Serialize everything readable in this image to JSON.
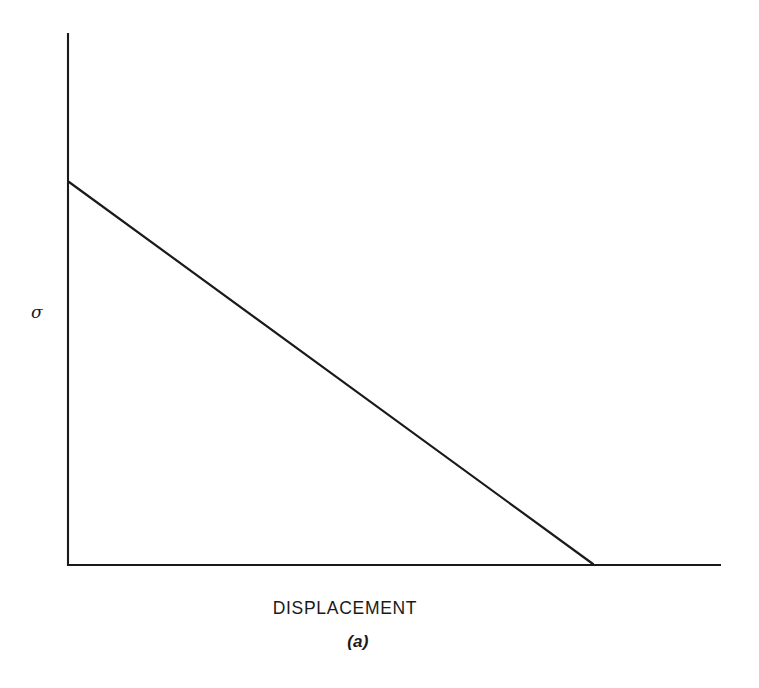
{
  "figure": {
    "caption": "(a)",
    "background_color": "#ffffff",
    "line_color": "#1a1a1a"
  },
  "chart_data": {
    "type": "line",
    "title": "",
    "subtitle": "",
    "xlabel": "DISPLACEMENT",
    "ylabel": "σ",
    "ylabel_description": "sigma (stress)",
    "grid": false,
    "legend": null,
    "axis_ticks": {
      "x": [],
      "y": []
    },
    "xlim": [
      0,
      1
    ],
    "ylim": [
      0,
      1
    ],
    "series": [
      {
        "name": "linear softening curve",
        "x": [
          0.0,
          1.0
        ],
        "y": [
          1.0,
          0.0
        ],
        "description": "straight descending line from peak stress on the vertical axis to zero stress at a finite displacement"
      }
    ],
    "annotations": [],
    "pixel_geometry": {
      "y_axis": {
        "x": 68,
        "y_top": 33,
        "y_bottom": 566
      },
      "x_axis": {
        "y": 565,
        "x_left": 68,
        "x_right": 721
      },
      "curve": {
        "x0": 69,
        "y0": 182,
        "x1": 593,
        "y1": 564
      }
    }
  }
}
